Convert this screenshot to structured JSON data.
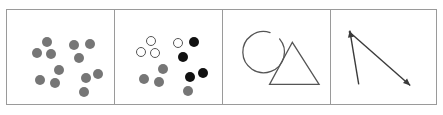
{
  "figure": {
    "title": "",
    "background_color": "#ffffff",
    "frame": {
      "border_color": "#9a9a9a",
      "border_width_px": 1,
      "x": 6,
      "y": 9,
      "width": 431,
      "height": 96,
      "panel_count": 4
    },
    "colors": {
      "gray_fill": "#767676",
      "gray_fill_light": "#8a8a8a",
      "black_fill": "#111111",
      "white_fill": "#ffffff",
      "outline": "#555555",
      "stroke": "#3a3a3a"
    }
  },
  "panels": [
    {
      "id": "panel-1",
      "label": "A",
      "type": "dot-array",
      "item_count": 12,
      "items": [
        {
          "name": "dot-1",
          "cx": 40,
          "cy": 32,
          "r": 5,
          "fill": "gray"
        },
        {
          "name": "dot-2",
          "cx": 30,
          "cy": 43,
          "r": 5,
          "fill": "gray"
        },
        {
          "name": "dot-3",
          "cx": 44,
          "cy": 44,
          "r": 5,
          "fill": "gray"
        },
        {
          "name": "dot-4",
          "cx": 67,
          "cy": 35,
          "r": 5,
          "fill": "gray"
        },
        {
          "name": "dot-5",
          "cx": 83,
          "cy": 34,
          "r": 5,
          "fill": "gray"
        },
        {
          "name": "dot-6",
          "cx": 72,
          "cy": 48,
          "r": 5,
          "fill": "gray"
        },
        {
          "name": "dot-7",
          "cx": 52,
          "cy": 60,
          "r": 5,
          "fill": "gray"
        },
        {
          "name": "dot-8",
          "cx": 33,
          "cy": 70,
          "r": 5,
          "fill": "gray"
        },
        {
          "name": "dot-9",
          "cx": 48,
          "cy": 73,
          "r": 5,
          "fill": "gray"
        },
        {
          "name": "dot-10",
          "cx": 79,
          "cy": 68,
          "r": 5,
          "fill": "gray"
        },
        {
          "name": "dot-11",
          "cx": 91,
          "cy": 64,
          "r": 5,
          "fill": "gray"
        },
        {
          "name": "dot-12",
          "cx": 77,
          "cy": 82,
          "r": 5,
          "fill": "gray"
        }
      ]
    },
    {
      "id": "panel-2",
      "label": "B",
      "type": "dot-array",
      "item_count": 12,
      "items": [
        {
          "name": "dot-1",
          "cx": 36,
          "cy": 31,
          "r": 5,
          "fill": "white"
        },
        {
          "name": "dot-2",
          "cx": 26,
          "cy": 42,
          "r": 5,
          "fill": "white"
        },
        {
          "name": "dot-3",
          "cx": 40,
          "cy": 43,
          "r": 5,
          "fill": "white"
        },
        {
          "name": "dot-4",
          "cx": 63,
          "cy": 33,
          "r": 5,
          "fill": "white"
        },
        {
          "name": "dot-5",
          "cx": 79,
          "cy": 32,
          "r": 5,
          "fill": "black"
        },
        {
          "name": "dot-6",
          "cx": 68,
          "cy": 47,
          "r": 5,
          "fill": "black"
        },
        {
          "name": "dot-7",
          "cx": 48,
          "cy": 59,
          "r": 5,
          "fill": "gray"
        },
        {
          "name": "dot-8",
          "cx": 29,
          "cy": 69,
          "r": 5,
          "fill": "gray"
        },
        {
          "name": "dot-9",
          "cx": 44,
          "cy": 72,
          "r": 5,
          "fill": "gray"
        },
        {
          "name": "dot-10",
          "cx": 75,
          "cy": 67,
          "r": 5,
          "fill": "black"
        },
        {
          "name": "dot-11",
          "cx": 88,
          "cy": 63,
          "r": 5,
          "fill": "black"
        },
        {
          "name": "dot-12",
          "cx": 73,
          "cy": 81,
          "r": 5,
          "fill": "gray"
        }
      ]
    },
    {
      "id": "panel-3",
      "label": "C",
      "type": "outline-shapes",
      "shapes": [
        {
          "name": "circle-outline",
          "cx": 41,
          "cy": 43,
          "r": 21,
          "stroke_width": 1.3,
          "gap": "top-right",
          "gap_start_deg": -72,
          "gap_end_deg": -40
        },
        {
          "name": "triangle-outline",
          "apex_x": 70,
          "apex_y": 33,
          "left_x": 47,
          "left_y": 76,
          "right_x": 97,
          "right_y": 76,
          "stroke_width": 1.3
        }
      ]
    },
    {
      "id": "panel-4",
      "label": "D",
      "type": "crossed-arrows",
      "arrows": [
        {
          "name": "arrow-up-left",
          "from_x": 28,
          "from_y": 76,
          "to_x": 19,
          "to_y": 21,
          "head_at": "to",
          "direction": "up-left",
          "stroke_width": 1.4
        },
        {
          "name": "arrow-down-right",
          "from_x": 18,
          "from_y": 22,
          "to_x": 80,
          "to_y": 77,
          "head_at": "to",
          "direction": "down-right",
          "stroke_width": 1.4
        }
      ]
    }
  ]
}
